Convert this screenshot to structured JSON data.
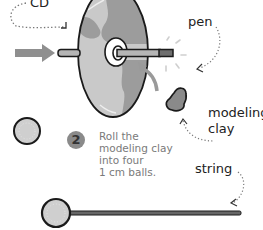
{
  "labels": {
    "cd": "CD",
    "pen": "pen",
    "modeling_clay_line1": "modeling",
    "modeling_clay_line2": "clay",
    "string": "string"
  },
  "step": {
    "number": "2",
    "lines": [
      "Roll the",
      "modeling clay",
      "into four",
      "1 cm balls."
    ]
  },
  "colors": {
    "outline": "#1a1a1a",
    "cd_light": "#c9c9c9",
    "cd_dark": "#9c9c9c",
    "arrow": "#8f8f8f",
    "pen_body": "#b5b5b5",
    "pen_cap": "#6e6e6e",
    "clay": "#8a8a8a",
    "ball": "#cfcfcf",
    "step_text": "#7a7a7a"
  },
  "icons": {
    "push_arrow": "arrow-right-icon",
    "cd": "cd-disc-icon",
    "pen": "pen-icon",
    "clay": "modeling-clay-icon",
    "ball": "clay-ball-icon",
    "string": "string-icon"
  }
}
